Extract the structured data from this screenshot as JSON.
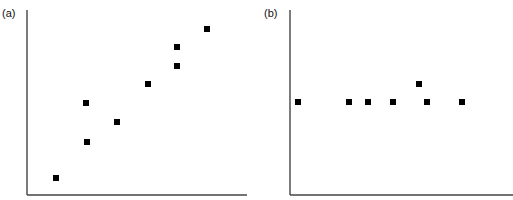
{
  "chart_data": [
    {
      "type": "scatter",
      "panel_label": "(a)",
      "title": "",
      "xlabel": "",
      "ylabel": "",
      "grid": false,
      "legend": null,
      "axis_px": {
        "x0": 27,
        "y0": 195,
        "x1": 247,
        "y1": 10
      },
      "points_px": [
        {
          "x": 56,
          "y": 178
        },
        {
          "x": 86,
          "y": 103
        },
        {
          "x": 87,
          "y": 142
        },
        {
          "x": 117,
          "y": 122
        },
        {
          "x": 148,
          "y": 84
        },
        {
          "x": 177,
          "y": 66
        },
        {
          "x": 177,
          "y": 47
        },
        {
          "x": 207,
          "y": 29
        }
      ],
      "points": [
        {
          "x": 0.13,
          "y": 0.09
        },
        {
          "x": 0.27,
          "y": 0.5
        },
        {
          "x": 0.27,
          "y": 0.29
        },
        {
          "x": 0.41,
          "y": 0.39
        },
        {
          "x": 0.55,
          "y": 0.6
        },
        {
          "x": 0.68,
          "y": 0.7
        },
        {
          "x": 0.68,
          "y": 0.8
        },
        {
          "x": 0.82,
          "y": 0.9
        }
      ],
      "trend": "positive correlation"
    },
    {
      "type": "scatter",
      "panel_label": "(b)",
      "title": "",
      "xlabel": "",
      "ylabel": "",
      "grid": false,
      "legend": null,
      "axis_px": {
        "x0": 290,
        "y0": 195,
        "x1": 513,
        "y1": 10
      },
      "points_px": [
        {
          "x": 298,
          "y": 102
        },
        {
          "x": 349,
          "y": 102
        },
        {
          "x": 368,
          "y": 102
        },
        {
          "x": 393,
          "y": 102
        },
        {
          "x": 419,
          "y": 84
        },
        {
          "x": 427,
          "y": 102
        },
        {
          "x": 462,
          "y": 102
        }
      ],
      "points": [
        {
          "x": 0.04,
          "y": 0.5
        },
        {
          "x": 0.26,
          "y": 0.5
        },
        {
          "x": 0.35,
          "y": 0.5
        },
        {
          "x": 0.46,
          "y": 0.5
        },
        {
          "x": 0.58,
          "y": 0.6
        },
        {
          "x": 0.61,
          "y": 0.5
        },
        {
          "x": 0.77,
          "y": 0.5
        }
      ],
      "trend": "no correlation (flat)"
    }
  ]
}
